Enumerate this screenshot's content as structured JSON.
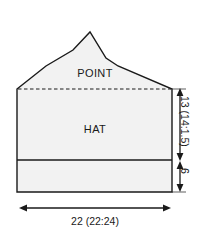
{
  "diagram": {
    "type": "hat-schematic",
    "sections": {
      "point_label": "POINT",
      "hat_label": "HAT"
    },
    "dimensions": {
      "width": {
        "value": "22 (22:24)",
        "orientation": "horizontal",
        "position": "bottom"
      },
      "crown_height": {
        "value": "13 (14:1.5)",
        "orientation": "vertical",
        "position": "right-upper"
      },
      "brim_height": {
        "value": "6",
        "orientation": "vertical",
        "position": "right-lower"
      }
    },
    "colors": {
      "fill": "#f2f2f2",
      "outline": "#1a1a1a",
      "dashed_guide": "#1a1a1a",
      "background": "#ffffff"
    }
  }
}
